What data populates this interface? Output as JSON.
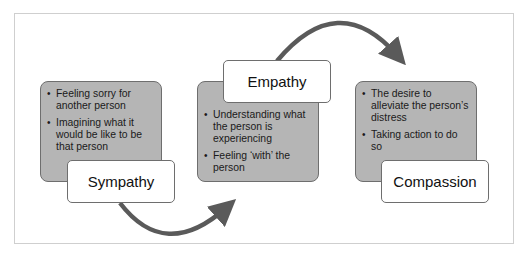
{
  "diagram": {
    "stages": [
      {
        "label": "Sympathy",
        "bullets": [
          "Feeling sorry for another person",
          "Imagining what it would be like to be that person"
        ]
      },
      {
        "label": "Empathy",
        "bullets": [
          "Understanding what the person is experiencing",
          "Feeling ‘with’ the person"
        ]
      },
      {
        "label": "Compassion",
        "bullets": [
          "The desire to alleviate the person’s distress",
          "Taking action to do so"
        ]
      }
    ],
    "colors": {
      "card_fill": "#b5b5b5",
      "card_border": "#6e6e6e",
      "arrow": "#5a5a5a",
      "frame": "#cfcfcf"
    }
  }
}
